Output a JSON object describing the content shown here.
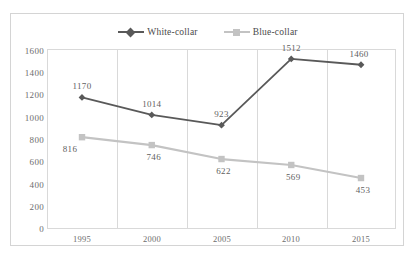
{
  "chart_data": {
    "type": "line",
    "title": "",
    "subtitle": "",
    "xlabel": "",
    "ylabel": "",
    "categories": [
      "1995",
      "2000",
      "2005",
      "2010",
      "2015"
    ],
    "series": [
      {
        "name": "White-collar",
        "color": "#595959",
        "marker": "diamond",
        "label_position": "above",
        "values": [
          1170,
          1014,
          923,
          1512,
          1460
        ]
      },
      {
        "name": "Blue-collar",
        "color": "#c3c3c3",
        "marker": "square",
        "label_position": "below",
        "values": [
          816,
          746,
          622,
          569,
          453
        ]
      }
    ],
    "ylim": [
      0,
      1600
    ],
    "ytick_step": 200,
    "yticks": [
      "1600",
      "1400",
      "1200",
      "1000",
      "800",
      "600",
      "400",
      "200",
      "0"
    ],
    "grid": {
      "horizontal": false,
      "vertical": true
    },
    "legend": {
      "position": "top-center",
      "entries": [
        "White-collar",
        "Blue-collar"
      ]
    },
    "frame": {
      "outer_border_color": "#d4d4d4",
      "plot_border_color": "#d9d9d9",
      "background": "#ffffff"
    },
    "axis_text_color": "#6d6d6d",
    "data_label_color": "#5f5f5f"
  }
}
